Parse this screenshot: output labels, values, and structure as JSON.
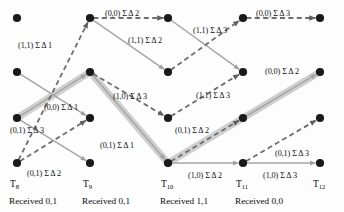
{
  "diagram": {
    "type": "viterbi-trellis",
    "width": 344,
    "height": 212,
    "colors": {
      "node": "#1a1a1a",
      "solid_edge": "#a6a6a6",
      "dashed_edge": "#6e6e6e",
      "highlight_path": "#cfcfcf",
      "text": "#111111",
      "background": "#fdfdfd"
    },
    "symbols": {
      "sigma": "Σ",
      "delta": "Δ"
    },
    "columns": [
      {
        "id": "T8",
        "label": "T",
        "subscript": "8",
        "x": 17,
        "received_label": "Received 0,1",
        "received_bits": "0,1"
      },
      {
        "id": "T9",
        "label": "T",
        "subscript": "9",
        "x": 90,
        "received_label": "Received 0,1",
        "received_bits": "0,1"
      },
      {
        "id": "T10",
        "label": "T",
        "subscript": "10",
        "x": 168,
        "received_label": "Received 1,1",
        "received_bits": "1,1"
      },
      {
        "id": "T11",
        "label": "T",
        "subscript": "11",
        "x": 243,
        "received_label": "Received 0,0",
        "received_bits": "0,0"
      },
      {
        "id": "T12",
        "label": "T",
        "subscript": "12",
        "x": 320,
        "received_label": "",
        "received_bits": ""
      }
    ],
    "state_rows": [
      {
        "row": 0,
        "y": 18
      },
      {
        "row": 1,
        "y": 72
      },
      {
        "row": 2,
        "y": 118
      },
      {
        "row": 3,
        "y": 163
      }
    ],
    "nodes": [
      {
        "id": "n8_0",
        "col": "T8",
        "row": 0,
        "x": 17,
        "y": 18
      },
      {
        "id": "n8_1",
        "col": "T8",
        "row": 1,
        "x": 17,
        "y": 72
      },
      {
        "id": "n8_2",
        "col": "T8",
        "row": 2,
        "x": 17,
        "y": 118
      },
      {
        "id": "n8_3",
        "col": "T8",
        "row": 3,
        "x": 17,
        "y": 163
      },
      {
        "id": "n9_0",
        "col": "T9",
        "row": 0,
        "x": 90,
        "y": 18
      },
      {
        "id": "n9_1",
        "col": "T9",
        "row": 1,
        "x": 90,
        "y": 72
      },
      {
        "id": "n9_2",
        "col": "T9",
        "row": 2,
        "x": 90,
        "y": 118
      },
      {
        "id": "n9_3",
        "col": "T9",
        "row": 3,
        "x": 90,
        "y": 163
      },
      {
        "id": "n10_0",
        "col": "T10",
        "row": 0,
        "x": 168,
        "y": 18
      },
      {
        "id": "n10_1",
        "col": "T10",
        "row": 1,
        "x": 168,
        "y": 72
      },
      {
        "id": "n10_2",
        "col": "T10",
        "row": 2,
        "x": 168,
        "y": 118
      },
      {
        "id": "n10_3",
        "col": "T10",
        "row": 3,
        "x": 168,
        "y": 163
      },
      {
        "id": "n11_0",
        "col": "T11",
        "row": 0,
        "x": 243,
        "y": 18
      },
      {
        "id": "n11_1",
        "col": "T11",
        "row": 1,
        "x": 243,
        "y": 72
      },
      {
        "id": "n11_2",
        "col": "T11",
        "row": 2,
        "x": 243,
        "y": 118
      },
      {
        "id": "n11_3",
        "col": "T11",
        "row": 3,
        "x": 243,
        "y": 163
      },
      {
        "id": "n12_0",
        "col": "T12",
        "row": 0,
        "x": 320,
        "y": 18
      },
      {
        "id": "n12_1",
        "col": "T12",
        "row": 1,
        "x": 320,
        "y": 72
      },
      {
        "id": "n12_2",
        "col": "T12",
        "row": 2,
        "x": 320,
        "y": 118
      },
      {
        "id": "n12_3",
        "col": "T12",
        "row": 3,
        "x": 320,
        "y": 163
      }
    ],
    "edges": [
      {
        "id": "e1",
        "from": "n8_1",
        "to": "n9_2",
        "style": "solid",
        "highlight": false
      },
      {
        "id": "e2",
        "from": "n8_2",
        "to": "n9_3",
        "style": "solid",
        "highlight": false
      },
      {
        "id": "e3",
        "from": "n8_2",
        "to": "n9_1",
        "style": "solid",
        "highlight": true
      },
      {
        "id": "e4",
        "from": "n8_3",
        "to": "n9_0",
        "style": "dashed",
        "highlight": false
      },
      {
        "id": "e5",
        "from": "n8_3",
        "to": "n9_2",
        "style": "dashed",
        "highlight": false
      },
      {
        "id": "e6",
        "from": "n9_0",
        "to": "n10_0",
        "style": "dashed",
        "highlight": false
      },
      {
        "id": "e7",
        "from": "n9_0",
        "to": "n10_1",
        "style": "solid",
        "highlight": false
      },
      {
        "id": "e8",
        "from": "n9_1",
        "to": "n10_3",
        "style": "solid",
        "highlight": true
      },
      {
        "id": "e9",
        "from": "n9_1",
        "to": "n10_2",
        "style": "dashed",
        "highlight": false
      },
      {
        "id": "e10",
        "from": "n10_0",
        "to": "n11_1",
        "style": "solid",
        "highlight": false
      },
      {
        "id": "e11",
        "from": "n10_1",
        "to": "n11_0",
        "style": "dashed",
        "highlight": false
      },
      {
        "id": "e12",
        "from": "n10_2",
        "to": "n11_1",
        "style": "dashed",
        "highlight": false
      },
      {
        "id": "e13",
        "from": "n10_3",
        "to": "n11_2",
        "style": "dashed",
        "highlight": true
      },
      {
        "id": "e14",
        "from": "n10_3",
        "to": "n11_3",
        "style": "solid",
        "highlight": false
      },
      {
        "id": "e15",
        "from": "n11_0",
        "to": "n12_0",
        "style": "dashed",
        "highlight": false
      },
      {
        "id": "e16",
        "from": "n11_2",
        "to": "n12_1",
        "style": "solid",
        "highlight": true
      },
      {
        "id": "e17",
        "from": "n11_3",
        "to": "n12_2",
        "style": "dashed",
        "highlight": false
      },
      {
        "id": "e18",
        "from": "n11_3",
        "to": "n12_3",
        "style": "solid",
        "highlight": false
      }
    ],
    "edge_labels": [
      {
        "id": "L1",
        "text": "(0,0) Σ Δ 2",
        "pair": "(0,0)",
        "metric": "Σ Δ 2",
        "x": 105,
        "y": 10
      },
      {
        "id": "L2",
        "text": "(0,0) Σ Δ 3",
        "pair": "(0,0)",
        "metric": "Σ Δ 3",
        "x": 256,
        "y": 10
      },
      {
        "id": "L3",
        "text": "(1,1) Σ Δ 1",
        "pair": "(1,1)",
        "metric": "Σ Δ 1",
        "x": 18,
        "y": 42
      },
      {
        "id": "L4",
        "text": "(1,1) Σ Δ 2",
        "pair": "(1,1)",
        "metric": "Σ Δ 2",
        "x": 128,
        "y": 37
      },
      {
        "id": "L5",
        "text": "(1,1) Σ Δ 3",
        "pair": "(1,1)",
        "metric": "Σ Δ 3",
        "x": 193,
        "y": 27
      },
      {
        "id": "L6",
        "text": "(0,0) Σ Δ 2",
        "pair": "(0,0)",
        "metric": "Σ Δ 2",
        "x": 265,
        "y": 68
      },
      {
        "id": "L7",
        "text": "(0,0) Σ Δ 1",
        "pair": "(0,0)",
        "metric": "Σ Δ 1",
        "x": 44,
        "y": 104
      },
      {
        "id": "L8",
        "text": "(1,0) Σ Δ 3",
        "pair": "(1,0)",
        "metric": "Σ Δ 3",
        "x": 113,
        "y": 93
      },
      {
        "id": "L9",
        "text": "(1,1) Σ Δ 3",
        "pair": "(1,1)",
        "metric": "Σ Δ 3",
        "x": 196,
        "y": 92
      },
      {
        "id": "L10",
        "text": "(0,1) Σ Δ 3",
        "pair": "(0,1)",
        "metric": "Σ Δ 3",
        "x": 10,
        "y": 127
      },
      {
        "id": "L11",
        "text": "(0,1) Σ Δ 1",
        "pair": "(0,1)",
        "metric": "Σ Δ 1",
        "x": 100,
        "y": 142
      },
      {
        "id": "L12",
        "text": "(0,1) Σ Δ 2",
        "pair": "(0,1)",
        "metric": "Σ Δ 2",
        "x": 175,
        "y": 127
      },
      {
        "id": "L13",
        "text": "(0,1) Σ Δ 2",
        "pair": "(0,1)",
        "metric": "Σ Δ 2",
        "x": 27,
        "y": 170
      },
      {
        "id": "L14",
        "text": "(0,1) Σ Δ 3",
        "pair": "(0,1)",
        "metric": "Σ Δ 3",
        "x": 275,
        "y": 150
      },
      {
        "id": "L15",
        "text": "(1,0) Σ Δ 2",
        "pair": "(1,0)",
        "metric": "Σ Δ 2",
        "x": 188,
        "y": 172
      },
      {
        "id": "L16",
        "text": "(1,0) Σ Δ 3",
        "pair": "(1,0)",
        "metric": "Σ Δ 3",
        "x": 263,
        "y": 172
      }
    ]
  }
}
